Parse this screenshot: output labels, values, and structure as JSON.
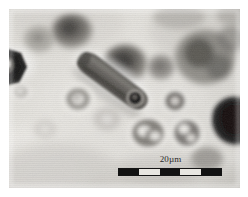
{
  "figure": {
    "kind": "optical-micrograph",
    "media": "grayscale photomicrograph of particles / droplets in a light matrix",
    "plate": {
      "x": 9,
      "y": 9,
      "width": 231,
      "height": 179,
      "background_color": "#d9d7d2",
      "matrix_light_color": "#e9e7e2",
      "matrix_mid_color": "#c6c3bd",
      "shadow_color": "#8d8a85",
      "dark_color": "#2a2a2a",
      "border_color": "#ffffff"
    }
  },
  "scale": {
    "label": "20µm",
    "length_value": 20,
    "unit": "µm",
    "bar": {
      "x": 118,
      "y": 168,
      "width": 104,
      "height": 8,
      "segments": 5,
      "segment_colors": [
        "#121212",
        "#e8e6e1",
        "#121212",
        "#e8e6e1",
        "#121212"
      ],
      "outline_color": "#141414"
    },
    "label_color": "#2b2b2b"
  },
  "features": [
    {
      "name": "elongated-rod-particle",
      "shape": "elongated capsule / rod",
      "orientation_deg": 35,
      "center": [
        113,
        80
      ],
      "length": 78,
      "width": 21,
      "tone": "dark-grey",
      "note": "bright halo rim, dark circular inclusion at lower-right tip"
    },
    {
      "name": "dark-crystal-left-edge",
      "shape": "angular faceted crystal",
      "center": [
        18,
        62
      ],
      "size": [
        30,
        40
      ],
      "tone": "near-black",
      "note": "clipped by left border, bright core spot"
    },
    {
      "name": "dark-blob-right-edge",
      "shape": "irregular rounded blob",
      "center": [
        226,
        120
      ],
      "size": [
        40,
        42
      ],
      "tone": "near-black",
      "note": "clipped by right border"
    },
    {
      "name": "dark-disc-upper-left",
      "shape": "diffuse disc",
      "center": [
        72,
        30
      ],
      "size": [
        36,
        32
      ],
      "tone": "dark-grey"
    },
    {
      "name": "dark-disc-upper-center",
      "shape": "diffuse disc",
      "center": [
        124,
        62
      ],
      "size": [
        36,
        34
      ],
      "tone": "dark-grey"
    },
    {
      "name": "dark-disc-upper-right",
      "shape": "diffuse cluster",
      "center": [
        200,
        58
      ],
      "size": [
        52,
        50
      ],
      "tone": "dark-grey"
    },
    {
      "name": "small-disc-top-right",
      "shape": "small disc",
      "center": [
        160,
        66
      ],
      "size": [
        24,
        24
      ],
      "tone": "mid-grey"
    },
    {
      "name": "ring-particle-left",
      "shape": "annulus with bright core",
      "center": [
        78,
        98
      ],
      "size": [
        26,
        26
      ],
      "tone": "mid-grey"
    },
    {
      "name": "ring-particle-center",
      "shape": "annulus with bright core",
      "center": [
        149,
        132
      ],
      "size": [
        34,
        30
      ],
      "tone": "mid-grey"
    },
    {
      "name": "ring-particle-right",
      "shape": "annulus with bright core",
      "center": [
        188,
        130
      ],
      "size": [
        28,
        30
      ],
      "tone": "mid-grey"
    },
    {
      "name": "ring-particle-small-center",
      "shape": "small annulus",
      "center": [
        176,
        100
      ],
      "size": [
        22,
        20
      ],
      "tone": "mid-grey"
    },
    {
      "name": "faint-disc-lower-left",
      "shape": "faint disc",
      "center": [
        108,
        118
      ],
      "size": [
        20,
        20
      ],
      "tone": "light-grey"
    },
    {
      "name": "faint-disc-bottom",
      "shape": "faint disc",
      "center": [
        45,
        128
      ],
      "size": [
        18,
        16
      ],
      "tone": "light-grey"
    },
    {
      "name": "diagonal-shadow-band",
      "shape": "soft diagonal band",
      "center": [
        60,
        160
      ],
      "tone": "light-grey",
      "note": "broad out-of-focus sweep across lower-left"
    }
  ]
}
